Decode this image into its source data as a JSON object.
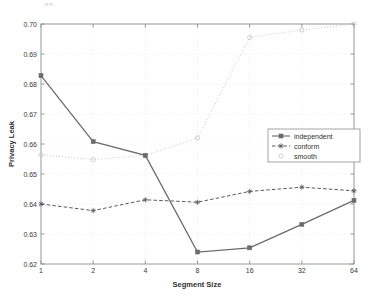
{
  "figure": {
    "artifact_text": "nn",
    "background": "#ffffff",
    "plot_box": {
      "left": 41,
      "top": 24,
      "right": 354,
      "bottom": 264
    },
    "axis_color": "#8f8f8f",
    "grid_color": "#d8d8d8"
  },
  "legend": {
    "position": "right-middle",
    "box_left": 268,
    "box_top": 129,
    "box_width": 92,
    "box_height": 33,
    "entries": [
      {
        "label": "independent",
        "color": "#6b6b6b",
        "style": "solid",
        "marker": "square"
      },
      {
        "label": "conform",
        "color": "#5a5a5a",
        "style": "dashed",
        "marker": "star"
      },
      {
        "label": "smooth",
        "color": "#c9c9c9",
        "style": "dotted",
        "marker": "circle"
      }
    ]
  },
  "chart_data": {
    "type": "line",
    "title": "",
    "subtitle": "",
    "xlabel": "Segment Size",
    "ylabel": "Privacy Leak",
    "x": [
      1,
      2,
      4,
      8,
      16,
      32,
      64
    ],
    "categories": [
      "1",
      "2",
      "4",
      "8",
      "16",
      "32",
      "64"
    ],
    "xticklabels": [
      "1",
      "2",
      "4",
      "8",
      "16",
      "32",
      "64"
    ],
    "yticklabels": [
      "0.62",
      "0.63",
      "0.64",
      "0.65",
      "0.66",
      "0.67",
      "0.68",
      "0.69",
      "0.70"
    ],
    "yticks": [
      0.62,
      0.63,
      0.64,
      0.65,
      0.66,
      0.67,
      0.68,
      0.69,
      0.7
    ],
    "ylim": [
      0.62,
      0.7
    ],
    "xlim_index": [
      0,
      6
    ],
    "xscale": "log2-even-spacing",
    "grid": true,
    "legend_position": "right",
    "series": [
      {
        "name": "independent",
        "color": "#6b6b6b",
        "style": "solid",
        "marker": "square",
        "values": [
          0.6828,
          0.6608,
          0.6562,
          0.624,
          0.6254,
          0.6332,
          0.6412
        ]
      },
      {
        "name": "conform",
        "color": "#5a5a5a",
        "style": "dashed",
        "marker": "star",
        "values": [
          0.64,
          0.6378,
          0.6414,
          0.6406,
          0.6442,
          0.6456,
          0.6444
        ]
      },
      {
        "name": "smooth",
        "color": "#c9c9c9",
        "style": "dotted",
        "marker": "circle",
        "values": [
          0.6564,
          0.6548,
          0.6562,
          0.662,
          0.6955,
          0.698,
          0.7
        ]
      }
    ]
  }
}
